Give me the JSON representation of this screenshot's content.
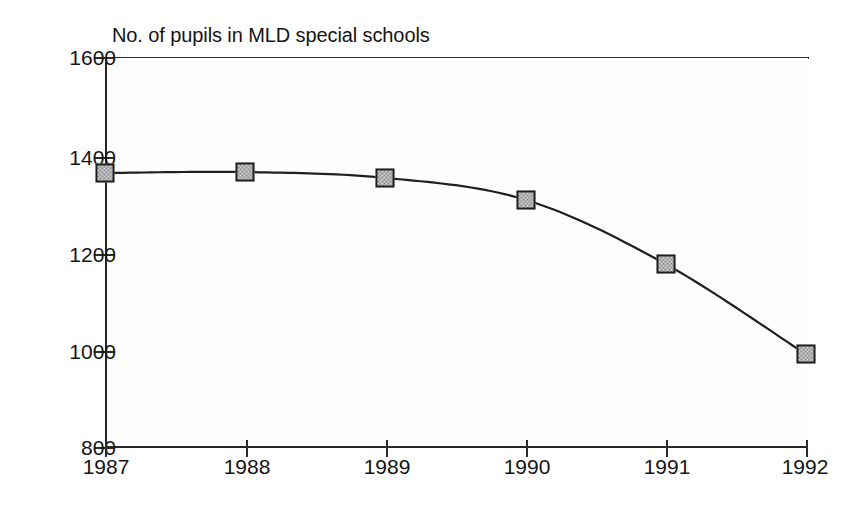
{
  "chart_data": {
    "type": "line",
    "title": "No. of pupils in MLD special schools",
    "xlabel": "",
    "ylabel": "",
    "grid": false,
    "legend": "none",
    "marker": "filled-square",
    "categories": [
      "1987",
      "1988",
      "1989",
      "1990",
      "1991",
      "1992"
    ],
    "x": [
      1987,
      1988,
      1989,
      1990,
      1991,
      1992
    ],
    "values": [
      1362,
      1364,
      1352,
      1307,
      1175,
      990
    ],
    "xlim": [
      1987,
      1992
    ],
    "ylim": [
      800,
      1600
    ],
    "yticks": [
      800,
      1000,
      1200,
      1400,
      1600
    ],
    "ytick_labels": [
      "800",
      "1000",
      "1200",
      "1400",
      "1600"
    ],
    "xtick_labels": [
      "1987",
      "1988",
      "1989",
      "1990",
      "1991",
      "1992"
    ],
    "series": [
      {
        "name": "No. of pupils in MLD special schools",
        "values": [
          1362,
          1364,
          1352,
          1307,
          1175,
          990
        ],
        "line_color": "#1f1f1f",
        "marker_fill": "#cfcfcf",
        "marker_edge": "#1f1f1f"
      }
    ],
    "colors": {
      "axis": "#2b2b2b",
      "line": "#1f1f1f",
      "marker_fill": "#cfcfcf",
      "marker_edge": "#1f1f1f",
      "background": "#ffffff",
      "plot_background": "#fdfdfd",
      "text": "#141414"
    }
  },
  "axis": {
    "y_labels": [
      "1600",
      "1400",
      "1200",
      "1000",
      "800"
    ],
    "x_labels": [
      "1987",
      "1988",
      "1989",
      "1990",
      "1991",
      "1992"
    ]
  }
}
